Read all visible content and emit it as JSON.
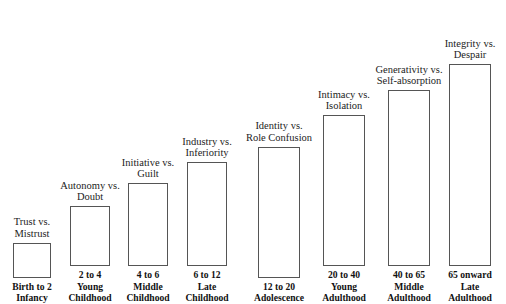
{
  "figure": {
    "title": "",
    "background": "#ffffff",
    "bar_fill": "#ffffff",
    "bar_stroke": "#555555",
    "text_color": "#1a1a1a"
  },
  "chart_data": {
    "type": "bar",
    "title": "",
    "xlabel": "",
    "ylabel": "",
    "grid": false,
    "legend": false,
    "ylim": [
      0,
      210
    ],
    "categories": [
      "Birth to 2 Infancy",
      "2 to 4 Young Childhood",
      "4 to 6 Middle Childhood",
      "6 to 12 Late Childhood",
      "12 to 20 Adolescence",
      "20 to 40 Young Adulthood",
      "40 to 65 Middle Adulthood",
      "65 onward Late Adulthood"
    ],
    "values": [
      35,
      60,
      83,
      104,
      131,
      151,
      176,
      202
    ],
    "annotations": [
      "Trust vs. Mistrust",
      "Autonomy vs. Doubt",
      "Initiative vs. Guilt",
      "Industry vs. Inferiority",
      "Identity vs. Role Confusion",
      "Intimacy vs. Isolation",
      "Generativity vs. Self-absorption",
      "Integrity vs. Despair"
    ]
  },
  "stages": [
    {
      "crisis_line1": "Trust vs.",
      "crisis_line2": "Mistrust",
      "age_line1": "Birth to 2",
      "age_line2": "Infancy",
      "age_line3": "",
      "height": 35,
      "left": 13,
      "width": 38
    },
    {
      "crisis_line1": "Autonomy vs.",
      "crisis_line2": "Doubt",
      "age_line1": "2 to 4",
      "age_line2": "Young",
      "age_line3": "Childhood",
      "height": 60,
      "left": 70,
      "width": 40
    },
    {
      "crisis_line1": "Initiative vs.",
      "crisis_line2": "Guilt",
      "age_line1": "4 to 6",
      "age_line2": "Middle",
      "age_line3": "Childhood",
      "height": 83,
      "left": 128,
      "width": 40
    },
    {
      "crisis_line1": "Industry vs.",
      "crisis_line2": "Inferiority",
      "age_line1": "6 to 12",
      "age_line2": "Late",
      "age_line3": "Childhood",
      "height": 104,
      "left": 187,
      "width": 40
    },
    {
      "crisis_line1": "Identity vs.",
      "crisis_line2": "Role Confusion",
      "age_line1": "12 to 20",
      "age_line2": "Adolescence",
      "age_line3": "",
      "height": 131,
      "left": 258,
      "width": 42
    },
    {
      "crisis_line1": "Intimacy vs.",
      "crisis_line2": "Isolation",
      "age_line1": "20 to 40",
      "age_line2": "Young",
      "age_line3": "Adulthood",
      "height": 151,
      "left": 323,
      "width": 42
    },
    {
      "crisis_line1": "Generativity vs.",
      "crisis_line2": "Self-absorption",
      "age_line1": "40 to 65",
      "age_line2": "Middle",
      "age_line3": "Adulthood",
      "height": 176,
      "left": 388,
      "width": 42
    },
    {
      "crisis_line1": "Integrity vs.",
      "crisis_line2": "Despair",
      "age_line1": "65 onward",
      "age_line2": "Late",
      "age_line3": "Adulthood",
      "height": 202,
      "left": 449,
      "width": 42
    }
  ]
}
